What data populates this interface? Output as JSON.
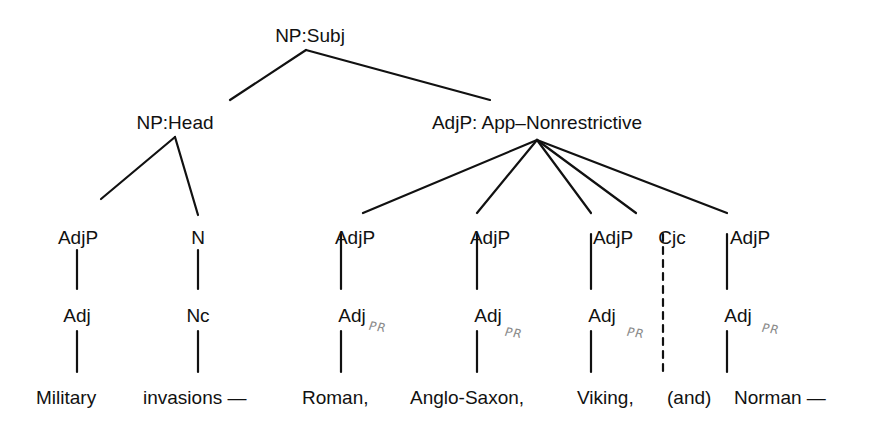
{
  "diagram": {
    "type": "syntax-tree",
    "root": {
      "label": "NP:Subj",
      "children": [
        {
          "label": "NP:Head",
          "children": [
            {
              "label": "AdjP",
              "child": "Adj",
              "word": "Military"
            },
            {
              "label": "N",
              "child": "Nc",
              "word": "invasions —"
            }
          ]
        },
        {
          "label": "AdjP: App–Nonrestrictive",
          "children": [
            {
              "label": "AdjP",
              "child": "Adj",
              "annotation": "PR",
              "word": "Roman,"
            },
            {
              "label": "AdjP",
              "child": "Adj",
              "annotation": "PR",
              "word": "Anglo-Saxon,"
            },
            {
              "label": "AdjP",
              "child": "Adj",
              "annotation": "PR",
              "word": "Viking,"
            },
            {
              "label": "Cjc",
              "child": null,
              "dashed": true,
              "word": "(and)"
            },
            {
              "label": "AdjP",
              "child": "Adj",
              "annotation": "PR",
              "word": "Norman —"
            }
          ]
        }
      ]
    }
  },
  "labels": {
    "np_subj": "NP:Subj",
    "np_head": "NP:Head",
    "adjp_app": "AdjP: App–Nonrestrictive",
    "adjp": "AdjP",
    "n": "N",
    "adj": "Adj",
    "nc": "Nc",
    "cjc": "Cjc",
    "pr": "PR"
  },
  "words": [
    "Military",
    "invasions —",
    "Roman,",
    "Anglo-Saxon,",
    "Viking,",
    "(and)",
    "Norman —"
  ],
  "colors": {
    "ink": "#111111",
    "annotation": "#8a8a8a"
  }
}
